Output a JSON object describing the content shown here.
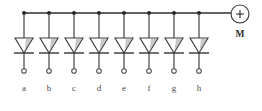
{
  "diagram": {
    "background_color": "#ffffff",
    "line_color": "#3c3c3c"
  },
  "chart_data": {
    "type": "diagram",
    "branch_count": 8,
    "branch_labels": [
      "a",
      "b",
      "c",
      "d",
      "e",
      "f",
      "g",
      "h"
    ],
    "branch_x": [
      24,
      49,
      74,
      99,
      124,
      149,
      174,
      199
    ],
    "bus_y": 13,
    "diode_top_y": 38,
    "diode_bar_y": 53,
    "terminal_circle_y": 71,
    "label_y": 91,
    "component_symbol": "diode",
    "diode_orientation": "cathode-down",
    "source": {
      "label": "M",
      "polarity": "+",
      "cx": 240,
      "cy": 14,
      "r": 9,
      "label_y": 33
    }
  },
  "branches": [
    {
      "id": "a",
      "label": "a",
      "x": 24
    },
    {
      "id": "b",
      "label": "b",
      "x": 49
    },
    {
      "id": "c",
      "label": "c",
      "x": 74
    },
    {
      "id": "d",
      "label": "d",
      "x": 99
    },
    {
      "id": "e",
      "label": "e",
      "x": 124
    },
    {
      "id": "f",
      "label": "f",
      "x": 149
    },
    {
      "id": "g",
      "label": "g",
      "x": 174
    },
    {
      "id": "h",
      "label": "h",
      "x": 199
    }
  ],
  "source": {
    "polarity_symbol": "+",
    "name": "M"
  }
}
